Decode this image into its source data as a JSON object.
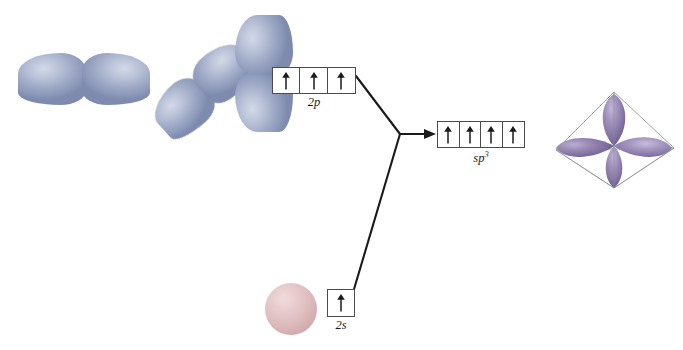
{
  "figure": {
    "background": "#ffffff"
  },
  "colors": {
    "p_orbital_blue": "#a9b4cc",
    "p_orbital_blue_light": "#d3d9e8",
    "p_orbital_blue_dark": "#7e8bae",
    "s_orbital_pink": "#debcbe",
    "s_orbital_pink_light": "#f0dcdc",
    "s_orbital_pink_dark": "#c59a9e",
    "hybrid_purple": "#8878a8",
    "hybrid_purple_light": "#b3a7c9",
    "hybrid_purple_dark": "#6b5c8c",
    "line_black": "#1a1a1a",
    "box_border": "#4b4b4b",
    "tetra_wire": "#9b9b9b"
  },
  "orbitals": {
    "p_set": {
      "name": "2p atomic orbitals",
      "count": 3,
      "members": [
        {
          "name": "p-x-orbital",
          "orientation": "horizontal",
          "angle_deg": 0
        },
        {
          "name": "p-y-orbital",
          "orientation": "diagonal",
          "angle_deg": -40
        },
        {
          "name": "p-z-orbital",
          "orientation": "vertical",
          "angle_deg": -90
        }
      ]
    },
    "s_orbital": {
      "name": "2s-atomic-orbital",
      "shape": "sphere"
    },
    "hybrid": {
      "name": "sp3-hybrid-orbital-set",
      "lobe_count": 4,
      "geometry": "tetrahedral",
      "wireframe": "tetrahedron"
    }
  },
  "boxes": {
    "p": {
      "id": "2p-orbital-boxes",
      "label": "2p",
      "label_base": "2",
      "label_italic": "p",
      "cells": 3,
      "electrons": [
        "up",
        "up",
        "up"
      ]
    },
    "s": {
      "id": "2s-orbital-box",
      "label": "2s",
      "label_base": "2",
      "label_italic": "s",
      "cells": 1,
      "electrons": [
        "up"
      ]
    },
    "sp3": {
      "id": "sp3-orbital-boxes",
      "label_main": "sp",
      "label_sup": "3",
      "cells": 4,
      "electrons": [
        "up",
        "up",
        "up",
        "up"
      ]
    }
  },
  "connectors": {
    "p_to_junction": {
      "from": [
        356,
        76
      ],
      "to": [
        400,
        134
      ]
    },
    "s_to_junction": {
      "from": [
        352,
        296
      ],
      "to": [
        400,
        134
      ]
    },
    "junction_to_sp3": {
      "from": [
        400,
        134
      ],
      "to": [
        434,
        134
      ],
      "arrowhead": true
    }
  }
}
